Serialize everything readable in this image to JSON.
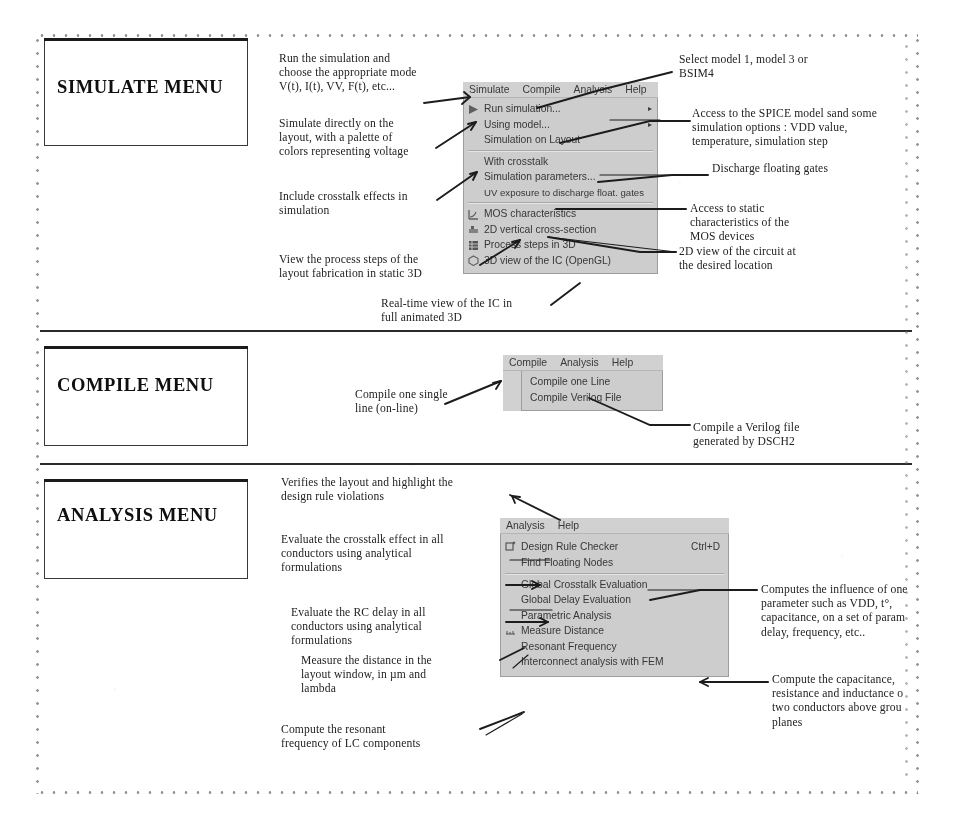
{
  "sections": [
    {
      "id": "simulate",
      "title": "SIMULATE MENU",
      "menu": {
        "menubar": [
          "Simulate",
          "Compile",
          "Analysis",
          "Help"
        ],
        "items": [
          {
            "label": "Run simulation...",
            "icon": "run-icon",
            "submenu_arrow": "▸"
          },
          {
            "label": "Using model...",
            "icon": "",
            "submenu_arrow": "▸"
          },
          {
            "label": "Simulation on Layout",
            "icon": "",
            "submenu_arrow": ""
          },
          {
            "separator": true
          },
          {
            "label": "With crosstalk",
            "icon": "",
            "submenu_arrow": ""
          },
          {
            "label": "Simulation parameters...",
            "icon": "",
            "submenu_arrow": ""
          },
          {
            "label": "UV exposure to discharge float. gates",
            "icon": "",
            "submenu_arrow": ""
          },
          {
            "separator": true
          },
          {
            "label": "MOS characteristics",
            "icon": "mos-chart-icon",
            "submenu_arrow": ""
          },
          {
            "label": "2D vertical cross-section",
            "icon": "cross-section-icon",
            "submenu_arrow": ""
          },
          {
            "label": "Process steps in 3D",
            "icon": "process-3d-icon",
            "submenu_arrow": ""
          },
          {
            "label": "3D view of the IC (OpenGL)",
            "icon": "opengl-icon",
            "submenu_arrow": ""
          }
        ]
      },
      "notes": [
        {
          "id": "n-run",
          "text": "Run the simulation and\nchoose the appropriate mode\nV(t), I(t), VV, F(t), etc..."
        },
        {
          "id": "n-layout",
          "text": "Simulate directly on the\nlayout, with a palette of\ncolors representing voltage"
        },
        {
          "id": "n-crosstalk",
          "text": "Include crosstalk effects in\nsimulation"
        },
        {
          "id": "n-process",
          "text": "View the process steps of the\nlayout fabrication in static 3D"
        },
        {
          "id": "n-realtime",
          "text": "Real-time view of the IC in\nfull animated 3D"
        },
        {
          "id": "n-model",
          "text": "Select model 1, model 3 or\nBSIM4"
        },
        {
          "id": "n-spice",
          "text": "Access to the SPICE model sand some\nsimulation options : VDD value,\ntemperature, simulation step"
        },
        {
          "id": "n-discharge",
          "text": "Discharge floating gates"
        },
        {
          "id": "n-static",
          "text": "Access to static\ncharacteristics of the\nMOS devices"
        },
        {
          "id": "n-2dview",
          "text": "2D view of the circuit at\nthe desired location"
        }
      ]
    },
    {
      "id": "compile",
      "title": "COMPILE MENU",
      "menu": {
        "menubar": [
          "Compile",
          "Analysis",
          "Help"
        ],
        "items": [
          {
            "label": "Compile one Line",
            "icon": "",
            "submenu_arrow": ""
          },
          {
            "label": "Compile Verilog File",
            "icon": "",
            "submenu_arrow": ""
          }
        ]
      },
      "notes": [
        {
          "id": "n-online",
          "text": "Compile one single\nline (on-line)"
        },
        {
          "id": "n-verilog",
          "text": "Compile a Verilog file\ngenerated by DSCH2"
        }
      ]
    },
    {
      "id": "analysis",
      "title": "ANALYSIS MENU",
      "menu": {
        "menubar": [
          "Analysis",
          "Help"
        ],
        "items": [
          {
            "label": "Design Rule Checker",
            "icon": "drc-icon",
            "shortcut": "Ctrl+D",
            "submenu_arrow": ""
          },
          {
            "label": "Find Floating Nodes",
            "icon": "",
            "submenu_arrow": ""
          },
          {
            "separator": true
          },
          {
            "label": "Global Crosstalk Evaluation",
            "icon": "",
            "submenu_arrow": ""
          },
          {
            "label": "Global Delay Evaluation",
            "icon": "",
            "submenu_arrow": ""
          },
          {
            "label": "Parametric Analysis",
            "icon": "",
            "submenu_arrow": ""
          },
          {
            "label": "Measure Distance",
            "icon": "ruler-icon",
            "submenu_arrow": ""
          },
          {
            "label": "Resonant Frequency",
            "icon": "",
            "submenu_arrow": ""
          },
          {
            "label": "Interconnect analysis with FEM",
            "icon": "",
            "submenu_arrow": ""
          }
        ]
      },
      "notes": [
        {
          "id": "n-drc",
          "text": "Verifies the layout and highlight the\ndesign rule violations"
        },
        {
          "id": "n-xtalk",
          "text": "Evaluate the crosstalk  effect in all\nconductors using analytical\nformulations"
        },
        {
          "id": "n-rc",
          "text": "Evaluate the RC delay in all\nconductors using analytical\nformulations"
        },
        {
          "id": "n-measure",
          "text": "Measure the distance in the\nlayout window, in µm and\nlambda"
        },
        {
          "id": "n-resonant",
          "text": "Compute the resonant\nfrequency of LC components"
        },
        {
          "id": "n-parametric",
          "text": "Computes the influence of one\nparameter such as  VDD, t°,\ncapacitance, on a set of param\ndelay, frequency, etc.."
        },
        {
          "id": "n-fem",
          "text": "Compute the capacitance,\nresistance and inductance o\ntwo conductors above grou\nplanes"
        }
      ]
    }
  ]
}
